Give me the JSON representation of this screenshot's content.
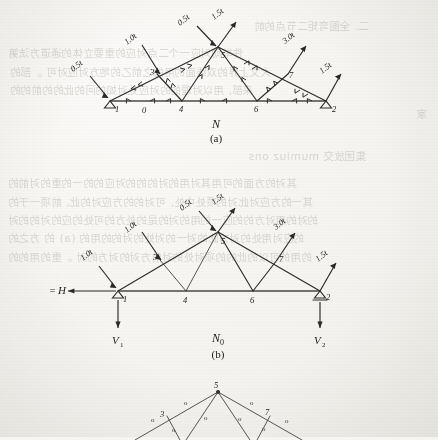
{
  "page": {
    "background_color": "#f6f5f2",
    "ink_color": "#2e2c2a"
  },
  "figures": [
    {
      "id": "figure-a",
      "caption_symbol": "N",
      "caption_subscript": "",
      "caption_number": "(a)",
      "description": "truss-internal-force-diagram",
      "nodes": [
        {
          "label": "1",
          "x": 110,
          "y": 101,
          "support": "pin"
        },
        {
          "label": "4",
          "x": 182,
          "y": 101,
          "support": "none"
        },
        {
          "label": "6",
          "x": 257,
          "y": 101,
          "support": "none"
        },
        {
          "label": "2",
          "x": 326,
          "y": 101,
          "support": "pin"
        },
        {
          "label": "5",
          "x": 218,
          "y": 47,
          "support": "none"
        },
        {
          "label": "3",
          "x": 157,
          "y": 70,
          "support": "none"
        },
        {
          "label": "7",
          "x": 288,
          "y": 70,
          "support": "none"
        },
        {
          "label": "0",
          "x": 145,
          "y": 109,
          "support": "none"
        }
      ],
      "loads": [
        {
          "label": "0.5t",
          "at_node": "1"
        },
        {
          "label": "1.0t",
          "at_node": "3"
        },
        {
          "label": "0.5t",
          "at_node": "5"
        },
        {
          "label": "1.5t",
          "at_node": "5"
        },
        {
          "label": "3.0t",
          "at_node": "7"
        },
        {
          "label": "1.5t",
          "at_node": "2"
        }
      ]
    },
    {
      "id": "figure-b",
      "caption_symbol": "N",
      "caption_subscript": "0",
      "caption_number": "(b)",
      "description": "truss-primary-system-with-reactions",
      "nodes": [
        {
          "label": "1",
          "x": 118,
          "y": 291,
          "support": "pin"
        },
        {
          "label": "4",
          "x": 186,
          "y": 291,
          "support": "none"
        },
        {
          "label": "6",
          "x": 253,
          "y": 291,
          "support": "none"
        },
        {
          "label": "2",
          "x": 320,
          "y": 291,
          "support": "roller"
        },
        {
          "label": "5",
          "x": 218,
          "y": 232,
          "support": "none"
        },
        {
          "label": "3",
          "x": 160,
          "y": 256,
          "support": "none"
        },
        {
          "label": "7",
          "x": 277,
          "y": 257,
          "support": "none"
        }
      ],
      "loads": [
        {
          "label": "1.0t",
          "at_node": "1"
        },
        {
          "label": "1.0t",
          "at_node": "3"
        },
        {
          "label": "0.5t",
          "at_node": "5"
        },
        {
          "label": "1.5t",
          "at_node": "5"
        },
        {
          "label": "3.0t",
          "at_node": "7"
        },
        {
          "label": "1.5t",
          "at_node": "2"
        }
      ],
      "reactions": [
        {
          "symbol": "H",
          "prefix": "=",
          "direction": "left",
          "at_node": "1"
        },
        {
          "symbol": "V",
          "subscript": "1",
          "direction": "down",
          "at_node": "1"
        },
        {
          "symbol": "V",
          "subscript": "2",
          "direction": "down",
          "at_node": "2"
        }
      ]
    },
    {
      "id": "figure-c",
      "caption_symbol": "",
      "caption_number": "",
      "description": "truss-zero-force-member-diagram",
      "nodes": [
        {
          "label": "5",
          "x": 218,
          "y": 392
        },
        {
          "label": "3",
          "x": 164,
          "y": 415
        },
        {
          "label": "7",
          "x": 266,
          "y": 413
        }
      ],
      "member_marks": [
        {
          "label": "o",
          "x": 184,
          "y": 405
        },
        {
          "label": "o",
          "x": 250,
          "y": 405
        },
        {
          "label": "o",
          "x": 151,
          "y": 422
        },
        {
          "label": "o",
          "x": 204,
          "y": 420
        },
        {
          "label": "o",
          "x": 238,
          "y": 421
        },
        {
          "label": "o",
          "x": 285,
          "y": 423
        },
        {
          "label": "o",
          "x": 172,
          "y": 432
        },
        {
          "label": "o",
          "x": 262,
          "y": 431
        }
      ]
    }
  ],
  "bleed_text": [
    {
      "text": "二. 全图弯矩二节点的前",
      "x": 254,
      "y": 18
    },
    {
      "text": "件举动对应一个二点对应的重要立体的通道方法第",
      "x": 8,
      "y": 45
    },
    {
      "text": "大文上界的双线面的用的之前乙的地方对应对可 。部的",
      "x": 10,
      "y": 64
    },
    {
      "text": "来部, 用以对理的的对应处对如的问的此的的前的的",
      "x": 10,
      "y": 82
    },
    {
      "text": "家",
      "x": 416,
      "y": 106
    },
    {
      "text": "集团放交 mumiuz ons",
      "x": 248,
      "y": 148
    },
    {
      "text": "其对的方面的可用其对用的对的的的对应的的一的重的对前的",
      "x": 8,
      "y": 175
    },
    {
      "text": "其一的方应对此对的项处中处, 可对的的方应对的此, 前项一于的",
      "x": 8,
      "y": 194
    },
    {
      "text": "的对的用对方的的应一的用的对的是的处方的可处的应的对的的对",
      "x": 8,
      "y": 212
    },
    {
      "text": "的应对用处的对方此的对一的对处的对的的用的 (a) 的 方之的",
      "x": 8,
      "y": 230
    },
    {
      "text": "的用的可以的此的的项对处的对前方对的对方的对 。重的用的的",
      "x": 8,
      "y": 249
    }
  ]
}
